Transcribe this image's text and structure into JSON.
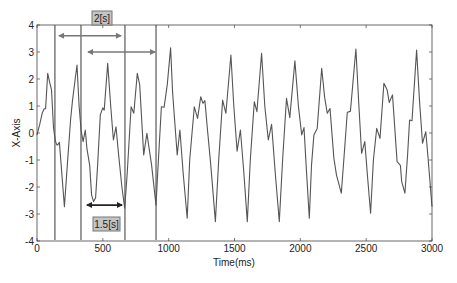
{
  "chart_data": {
    "type": "line",
    "title": "",
    "xlabel": "Time(ms)",
    "ylabel": "X-Axis",
    "xlim": [
      0,
      3000
    ],
    "ylim": [
      -4,
      4
    ],
    "grid": false,
    "legend": null,
    "x_ticks": [
      0,
      500,
      1000,
      1500,
      2000,
      2500,
      3000
    ],
    "y_ticks": [
      -4,
      -3,
      -2,
      -1,
      0,
      1,
      2,
      3,
      4
    ],
    "series": [
      {
        "name": "signal",
        "color": "#555555",
        "points": [
          [
            0,
            -0.07
          ],
          [
            20,
            0.3
          ],
          [
            40,
            0.75
          ],
          [
            55,
            0.9
          ],
          [
            65,
            0.9
          ],
          [
            81,
            2.21
          ],
          [
            95,
            1.9
          ],
          [
            110,
            1.6
          ],
          [
            125,
            0.2
          ],
          [
            140,
            -0.3
          ],
          [
            150,
            -0.44
          ],
          [
            157,
            -0.44
          ],
          [
            170,
            -0.35
          ],
          [
            185,
            -1.3
          ],
          [
            208,
            -2.73
          ],
          [
            230,
            -1.2
          ],
          [
            255,
            0.5
          ],
          [
            270,
            1.2
          ],
          [
            290,
            2.0
          ],
          [
            304,
            2.52
          ],
          [
            320,
            1.0
          ],
          [
            335,
            0.1
          ],
          [
            350,
            -0.32
          ],
          [
            367,
            0.11
          ],
          [
            380,
            -0.6
          ],
          [
            400,
            -1.2
          ],
          [
            415,
            -2.3
          ],
          [
            430,
            -2.54
          ],
          [
            445,
            -2.4
          ],
          [
            460,
            -1.2
          ],
          [
            481,
            0.67
          ],
          [
            500,
            0.93
          ],
          [
            510,
            0.85
          ],
          [
            537,
            2.58
          ],
          [
            560,
            1.0
          ],
          [
            580,
            -0.26
          ],
          [
            600,
            0.23
          ],
          [
            620,
            -0.8
          ],
          [
            645,
            -2.0
          ],
          [
            666,
            -2.79
          ],
          [
            685,
            -1.5
          ],
          [
            715,
            0.97
          ],
          [
            735,
            0.73
          ],
          [
            762,
            2.21
          ],
          [
            780,
            1.78
          ],
          [
            810,
            -0.81
          ],
          [
            835,
            -0.01
          ],
          [
            870,
            -1.19
          ],
          [
            904,
            -2.67
          ],
          [
            920,
            -1.2
          ],
          [
            945,
            0.97
          ],
          [
            965,
            0.95
          ],
          [
            990,
            1.8
          ],
          [
            1015,
            3.16
          ],
          [
            1030,
            1.5
          ],
          [
            1065,
            -0.81
          ],
          [
            1085,
            0.11
          ],
          [
            1110,
            -1.5
          ],
          [
            1141,
            -3.16
          ],
          [
            1160,
            -1.0
          ],
          [
            1195,
            0.97
          ],
          [
            1220,
            0.54
          ],
          [
            1243,
            1.34
          ],
          [
            1260,
            1.1
          ],
          [
            1275,
            1.2
          ],
          [
            1295,
            0.11
          ],
          [
            1320,
            -1.2
          ],
          [
            1355,
            -3.28
          ],
          [
            1380,
            -1.0
          ],
          [
            1410,
            1.22
          ],
          [
            1435,
            0.73
          ],
          [
            1473,
            2.89
          ],
          [
            1495,
            1.0
          ],
          [
            1520,
            -0.67
          ],
          [
            1545,
            0.11
          ],
          [
            1570,
            -1.4
          ],
          [
            1597,
            -3.28
          ],
          [
            1620,
            -1.0
          ],
          [
            1650,
            1.16
          ],
          [
            1670,
            0.79
          ],
          [
            1706,
            2.95
          ],
          [
            1730,
            1.0
          ],
          [
            1757,
            -0.26
          ],
          [
            1782,
            0.32
          ],
          [
            1810,
            -1.5
          ],
          [
            1840,
            -3.28
          ],
          [
            1865,
            -1.0
          ],
          [
            1895,
            1.28
          ],
          [
            1920,
            0.57
          ],
          [
            1959,
            2.67
          ],
          [
            1985,
            1.0
          ],
          [
            2010,
            -0.07
          ],
          [
            2028,
            0.2
          ],
          [
            2045,
            -1.3
          ],
          [
            2068,
            -3.16
          ],
          [
            2085,
            -1.2
          ],
          [
            2103,
            -0.07
          ],
          [
            2128,
            0.17
          ],
          [
            2162,
            2.4
          ],
          [
            2185,
            1.3
          ],
          [
            2205,
            0.73
          ],
          [
            2225,
            0.91
          ],
          [
            2255,
            -0.94
          ],
          [
            2275,
            -1.56
          ],
          [
            2311,
            -2.23
          ],
          [
            2330,
            -1.0
          ],
          [
            2357,
            0.77
          ],
          [
            2380,
            0.8
          ],
          [
            2422,
            3.11
          ],
          [
            2445,
            1.0
          ],
          [
            2465,
            -0.75
          ],
          [
            2490,
            -0.32
          ],
          [
            2510,
            -1.6
          ],
          [
            2534,
            -2.97
          ],
          [
            2555,
            -1.0
          ],
          [
            2580,
            0.17
          ],
          [
            2605,
            -0.2
          ],
          [
            2635,
            1.84
          ],
          [
            2660,
            1.59
          ],
          [
            2675,
            1.13
          ],
          [
            2700,
            1.41
          ],
          [
            2735,
            -1.06
          ],
          [
            2760,
            -1.2
          ],
          [
            2770,
            -1.8
          ],
          [
            2794,
            -2.23
          ],
          [
            2815,
            -0.8
          ],
          [
            2830,
            0.48
          ],
          [
            2848,
            0.45
          ],
          [
            2883,
            3.07
          ],
          [
            2905,
            1.2
          ],
          [
            2928,
            -0.38
          ],
          [
            2953,
            0.05
          ],
          [
            2970,
            -0.94
          ],
          [
            3000,
            -2.73
          ]
        ]
      }
    ],
    "vertical_markers_ms": [
      136,
      334,
      668,
      904
    ],
    "annotations": [
      {
        "label": "2[s]",
        "type": "interval",
        "from_ms": 160,
        "to_ms": 645,
        "y_value": 3.6,
        "color": "#777777"
      },
      {
        "label": "",
        "type": "interval",
        "from_ms": 380,
        "to_ms": 904,
        "y_value": 3.0,
        "color": "#777777"
      },
      {
        "label": "1.5[s]",
        "type": "interval",
        "from_ms": 372,
        "to_ms": 653,
        "y_value": -2.67,
        "color": "#222222"
      }
    ]
  },
  "labels": {
    "x_axis": "Time(ms)",
    "y_axis": "X-Axis",
    "annot_top": "2[s]",
    "annot_bottom": "1.5[s]"
  },
  "colors": {
    "signal": "#555555",
    "marker_line": "#666666",
    "annot_box_fill": "#c4c4c4",
    "annot_box_border": "#777777",
    "axis": "#444444"
  }
}
